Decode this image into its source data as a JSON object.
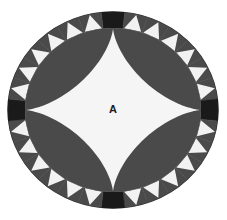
{
  "figure": {
    "type": "geometric-diagram",
    "canvas": {
      "width": 227,
      "height": 220,
      "background": "#ffffff"
    },
    "center": {
      "x": 113,
      "y": 110
    },
    "outer_circle": {
      "radius_x": 105,
      "radius_y": 98,
      "border_color": "#2b2b2b"
    },
    "inner_circle": {
      "radius_x": 88,
      "radius_y": 82,
      "fill": "#4a4a4a"
    },
    "ring": {
      "segment_count": 28,
      "segments_per_quadrant": 6,
      "segment_fill": "#4a4a4a",
      "triangle_fill": "#f2f2f2",
      "cardinal_block_fill": "#1a1a1a",
      "cardinal_block_count": 4,
      "cardinal_block_positions": [
        "north",
        "east",
        "south",
        "west"
      ]
    },
    "astroid": {
      "fill": "#f5f5f5",
      "cusp_radius_x": 88,
      "cusp_radius_y": 82,
      "label": "A",
      "label_x": 113,
      "label_y": 110
    },
    "colors": {
      "background": "#ffffff",
      "dark_gray": "#4a4a4a",
      "near_black": "#1a1a1a",
      "off_white": "#f2f2f2",
      "astroid_white": "#f5f5f5",
      "label_text": "#1c1c1c"
    }
  }
}
